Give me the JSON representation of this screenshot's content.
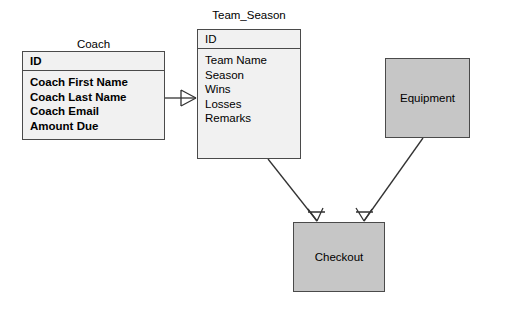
{
  "diagram": {
    "type": "entity-relationship-diagram",
    "background_color": "#ffffff",
    "line_color": "#333333"
  },
  "entities": {
    "coach": {
      "title": "Coach",
      "primary_key": "ID",
      "attributes": [
        "Coach First Name",
        "Coach Last Name",
        "Coach Email",
        "Amount Due"
      ],
      "fill_color": "#f1f1f1"
    },
    "team_season": {
      "title": "Team_Season",
      "primary_key": "ID",
      "attributes": [
        "Team Name",
        "Season",
        "Wins",
        "Losses",
        "Remarks"
      ],
      "fill_color": "#f1f1f1"
    },
    "equipment": {
      "label": "Equipment",
      "fill_color": "#c6c6c6"
    },
    "checkout": {
      "label": "Checkout",
      "fill_color": "#c6c6c6"
    }
  },
  "relationships": [
    {
      "name": "coach-to-team-season",
      "from": "Coach",
      "to": "Team_Season",
      "crow_foot_at": "Team_Season"
    },
    {
      "name": "team-season-to-checkout",
      "from": "Team_Season",
      "to": "Checkout",
      "crow_foot_at": "Checkout"
    },
    {
      "name": "equipment-to-checkout",
      "from": "Equipment",
      "to": "Checkout",
      "crow_foot_at": "Checkout"
    }
  ]
}
